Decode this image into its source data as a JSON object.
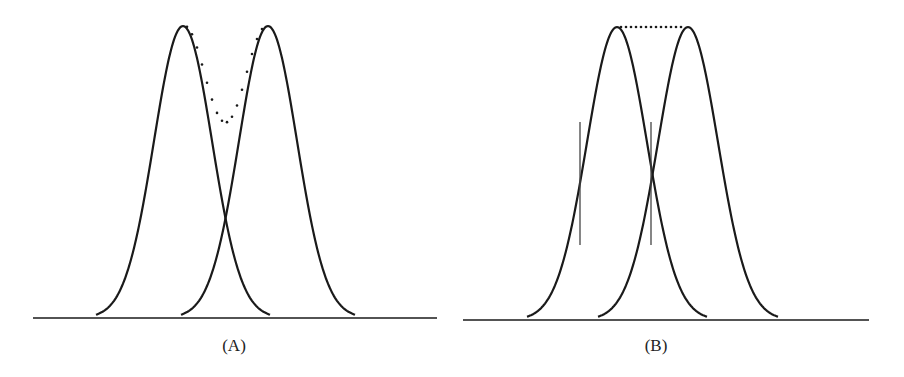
{
  "panels": [
    {
      "id": "A",
      "label": "(A)",
      "description": "Two overlapping Gaussian peaks with their dotted sum showing a dip between peaks (resolved)",
      "baseline": {
        "x1": 33,
        "x2": 437,
        "y": 318
      },
      "curves": [
        {
          "center": 183,
          "sigma": 29,
          "height": 292
        },
        {
          "center": 268,
          "sigma": 29,
          "height": 292
        }
      ],
      "sum_curve": "dotted",
      "label_pos": {
        "x": 234,
        "y": 336
      }
    },
    {
      "id": "B",
      "label": "(B)",
      "description": "Two Gaussian peaks at the Sparrow/Rayleigh-like limit; dotted flat top; vertical tangent markers at inflection points",
      "baseline": {
        "x1": 463,
        "x2": 869,
        "y": 320
      },
      "curves": [
        {
          "center": 617,
          "sigma": 30,
          "height": 293
        },
        {
          "center": 688,
          "sigma": 30,
          "height": 293
        }
      ],
      "sum_curve": "dotted-flat",
      "markers": [
        {
          "x": 580,
          "y1": 122,
          "y2": 245
        },
        {
          "x": 651,
          "y1": 122,
          "y2": 245
        }
      ],
      "label_pos": {
        "x": 656,
        "y": 336
      }
    }
  ],
  "colors": {
    "line": "#1a1a1a",
    "marker": "#444444",
    "background": "#ffffff"
  }
}
